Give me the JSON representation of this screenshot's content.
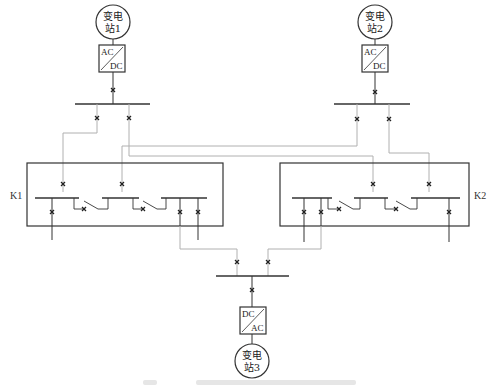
{
  "stations": [
    {
      "id": "station-1",
      "line1": "变电",
      "line2": "站1",
      "cx": 113,
      "cy": 22
    },
    {
      "id": "station-2",
      "line1": "变电",
      "line2": "站2",
      "cx": 375,
      "cy": 22
    },
    {
      "id": "station-3",
      "line1": "变电",
      "line2": "站3",
      "cx": 252,
      "cy": 361
    }
  ],
  "converters": [
    {
      "id": "converter-1",
      "top": "AC",
      "bottom": "DC",
      "x": 99,
      "y": 45
    },
    {
      "id": "converter-2",
      "top": "AC",
      "bottom": "DC",
      "x": 362,
      "y": 45
    },
    {
      "id": "converter-3",
      "top": "DC",
      "bottom": "AC",
      "x": 240,
      "y": 307
    }
  ],
  "groups": [
    {
      "id": "K1",
      "label": "K1"
    },
    {
      "id": "K2",
      "label": "K2"
    }
  ],
  "caption": {
    "visible": true,
    "legible": false
  },
  "colors": {
    "line": "#333333",
    "feeder": "#b0b0b0",
    "breaker": "#222222"
  }
}
